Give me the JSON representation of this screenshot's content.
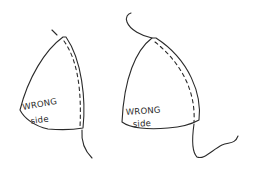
{
  "diagram": {
    "title": "",
    "stroke_color": "#2a2a2a",
    "background_color": "#ffffff",
    "pieces": [
      {
        "id": "left-cup",
        "label_line1": "WRONG",
        "label_line2": "side",
        "seam": "dashed stitch line along right edge"
      },
      {
        "id": "right-cup",
        "label_line1": "WRONG",
        "label_line2": "side",
        "seam": "dashed stitch line along right edge"
      }
    ]
  }
}
